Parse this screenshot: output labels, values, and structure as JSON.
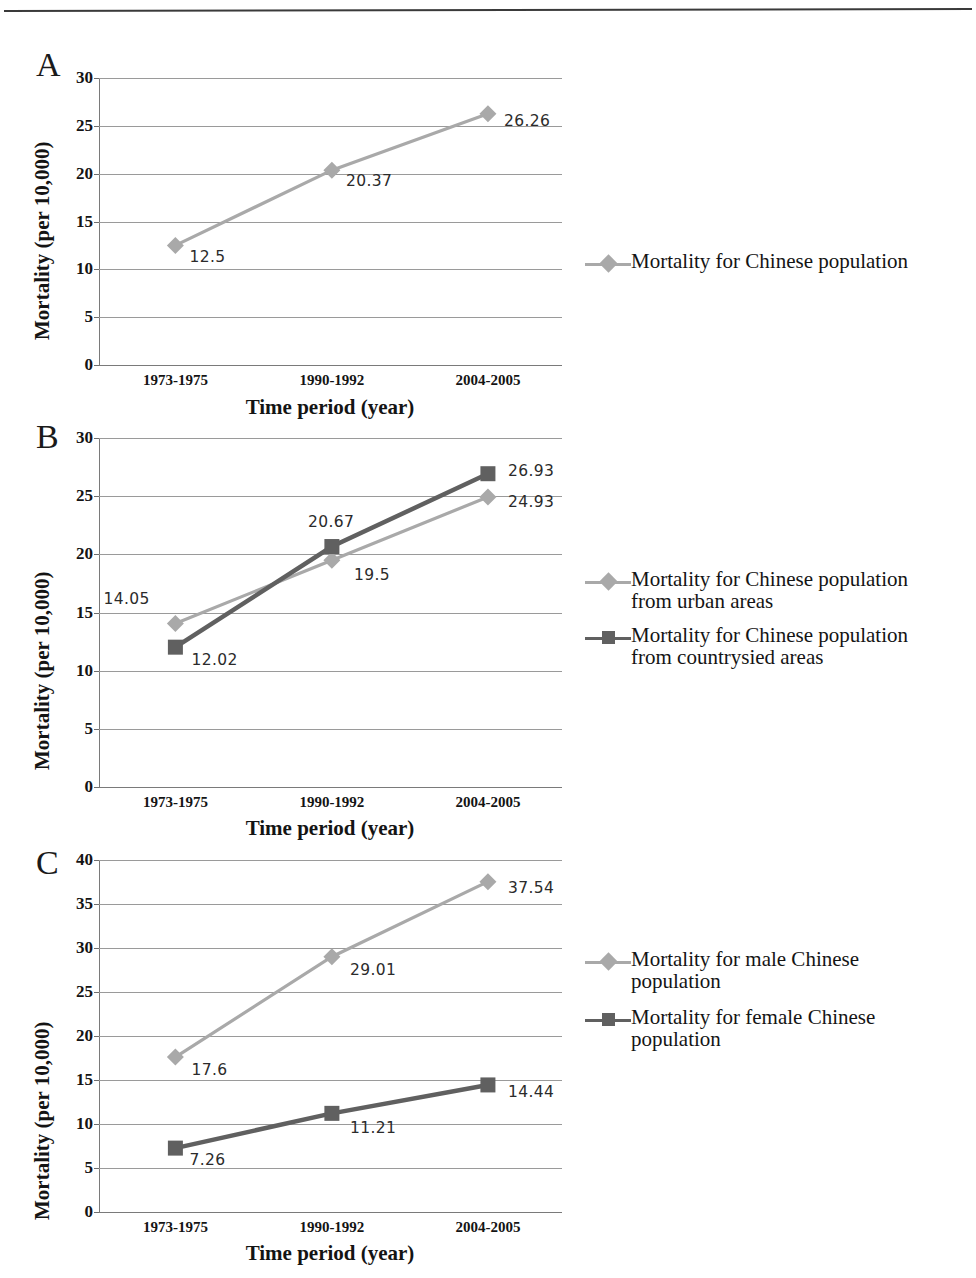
{
  "page": {
    "has_top_rule": true
  },
  "colors": {
    "light_series": "#a9a9a9",
    "dark_series": "#606060",
    "grid": "#9a9a9a",
    "axis": "#7a7a7a",
    "text": "#141414",
    "label_text": "#2b2b2b"
  },
  "axis_common": {
    "xlabel": "Time period (year)",
    "ylabel": "Mortality (per 10,000)",
    "xticks": [
      "1973-1975",
      "1990-1992",
      "2004-2005"
    ]
  },
  "panels": [
    {
      "letter": "A",
      "yticks": [
        "0",
        "5",
        "10",
        "15",
        "20",
        "25",
        "30"
      ],
      "point_labels": [
        "12.5",
        "20.37",
        "26.26"
      ],
      "legend": [
        {
          "label_line1": "Mortality for Chinese population",
          "label_line2": "",
          "marker": "diamond",
          "color": "light"
        }
      ]
    },
    {
      "letter": "B",
      "yticks": [
        "0",
        "5",
        "10",
        "15",
        "20",
        "25",
        "30"
      ],
      "point_labels_urban": [
        "14.05",
        "19.5",
        "24.93"
      ],
      "point_labels_country": [
        "12.02",
        "20.67",
        "26.93"
      ],
      "legend": [
        {
          "label_line1": "Mortality for Chinese population",
          "label_line2": "from urban areas",
          "marker": "diamond",
          "color": "light"
        },
        {
          "label_line1": "Mortality for Chinese population",
          "label_line2": "from countrysied areas",
          "marker": "square",
          "color": "dark"
        }
      ]
    },
    {
      "letter": "C",
      "yticks": [
        "0",
        "5",
        "10",
        "15",
        "20",
        "25",
        "30",
        "35",
        "40"
      ],
      "point_labels_male": [
        "17.6",
        "29.01",
        "37.54"
      ],
      "point_labels_female": [
        "7.26",
        "11.21",
        "14.44"
      ],
      "legend": [
        {
          "label_line1": "Mortality for male Chinese",
          "label_line2": "population",
          "marker": "diamond",
          "color": "light"
        },
        {
          "label_line1": "Mortality for female Chinese",
          "label_line2": "population",
          "marker": "square",
          "color": "dark"
        }
      ]
    }
  ],
  "chart_data": [
    {
      "type": "line",
      "panel": "A",
      "title": "",
      "xlabel": "Time period (year)",
      "ylabel": "Mortality (per 10,000)",
      "categories": [
        "1973-1975",
        "1990-1992",
        "2004-2005"
      ],
      "ylim": [
        0,
        30
      ],
      "yticks": [
        0,
        5,
        10,
        15,
        20,
        25,
        30
      ],
      "grid": true,
      "legend_position": "right",
      "series": [
        {
          "name": "Mortality for Chinese population",
          "values": [
            12.5,
            20.37,
            26.26
          ],
          "marker": "diamond",
          "color": "#a9a9a9"
        }
      ]
    },
    {
      "type": "line",
      "panel": "B",
      "title": "",
      "xlabel": "Time period (year)",
      "ylabel": "Mortality (per 10,000)",
      "categories": [
        "1973-1975",
        "1990-1992",
        "2004-2005"
      ],
      "ylim": [
        0,
        30
      ],
      "yticks": [
        0,
        5,
        10,
        15,
        20,
        25,
        30
      ],
      "grid": true,
      "legend_position": "right",
      "series": [
        {
          "name": "Mortality for Chinese population from urban areas",
          "values": [
            14.05,
            19.5,
            24.93
          ],
          "marker": "diamond",
          "color": "#a9a9a9"
        },
        {
          "name": "Mortality for Chinese population from countrysied areas",
          "values": [
            12.02,
            20.67,
            26.93
          ],
          "marker": "square",
          "color": "#606060"
        }
      ]
    },
    {
      "type": "line",
      "panel": "C",
      "title": "",
      "xlabel": "Time period (year)",
      "ylabel": "Mortality (per 10,000)",
      "categories": [
        "1973-1975",
        "1990-1992",
        "2004-2005"
      ],
      "ylim": [
        0,
        40
      ],
      "yticks": [
        0,
        5,
        10,
        15,
        20,
        25,
        30,
        35,
        40
      ],
      "grid": true,
      "legend_position": "right",
      "series": [
        {
          "name": "Mortality for male Chinese population",
          "values": [
            17.6,
            29.01,
            37.54
          ],
          "marker": "diamond",
          "color": "#a9a9a9"
        },
        {
          "name": "Mortality for female Chinese population",
          "values": [
            7.26,
            11.21,
            14.44
          ],
          "marker": "square",
          "color": "#606060"
        }
      ]
    }
  ]
}
